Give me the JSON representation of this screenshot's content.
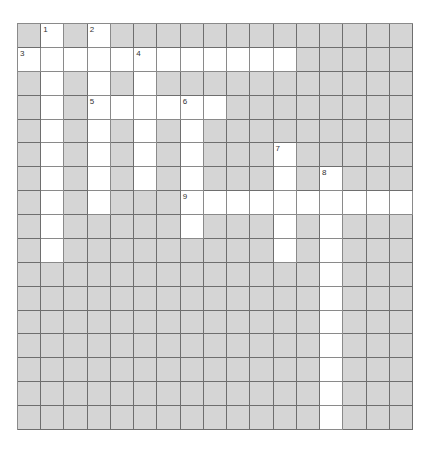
{
  "puzzle": {
    "rows": 17,
    "cols": 17,
    "colors": {
      "block": "#d5d5d5",
      "open": "#ffffff",
      "line": "#6e6e6e"
    },
    "open_cells": [
      [
        0,
        1
      ],
      [
        0,
        3
      ],
      [
        1,
        0
      ],
      [
        1,
        1
      ],
      [
        1,
        2
      ],
      [
        1,
        3
      ],
      [
        1,
        4
      ],
      [
        1,
        5
      ],
      [
        1,
        6
      ],
      [
        1,
        7
      ],
      [
        1,
        8
      ],
      [
        1,
        9
      ],
      [
        1,
        10
      ],
      [
        1,
        11
      ],
      [
        2,
        1
      ],
      [
        2,
        3
      ],
      [
        2,
        5
      ],
      [
        3,
        1
      ],
      [
        3,
        3
      ],
      [
        3,
        4
      ],
      [
        3,
        5
      ],
      [
        3,
        6
      ],
      [
        3,
        7
      ],
      [
        3,
        8
      ],
      [
        4,
        1
      ],
      [
        4,
        3
      ],
      [
        4,
        5
      ],
      [
        4,
        7
      ],
      [
        5,
        1
      ],
      [
        5,
        3
      ],
      [
        5,
        5
      ],
      [
        5,
        7
      ],
      [
        5,
        11
      ],
      [
        6,
        1
      ],
      [
        6,
        3
      ],
      [
        6,
        5
      ],
      [
        6,
        7
      ],
      [
        6,
        11
      ],
      [
        6,
        13
      ],
      [
        7,
        1
      ],
      [
        7,
        3
      ],
      [
        7,
        7
      ],
      [
        7,
        8
      ],
      [
        7,
        9
      ],
      [
        7,
        10
      ],
      [
        7,
        11
      ],
      [
        7,
        12
      ],
      [
        7,
        13
      ],
      [
        7,
        14
      ],
      [
        7,
        15
      ],
      [
        7,
        16
      ],
      [
        8,
        1
      ],
      [
        8,
        7
      ],
      [
        8,
        11
      ],
      [
        8,
        13
      ],
      [
        9,
        1
      ],
      [
        9,
        11
      ],
      [
        9,
        13
      ],
      [
        10,
        13
      ],
      [
        11,
        13
      ],
      [
        12,
        13
      ],
      [
        13,
        13
      ],
      [
        14,
        13
      ],
      [
        15,
        13
      ],
      [
        16,
        13
      ]
    ],
    "clue_numbers": [
      {
        "row": 0,
        "col": 1,
        "label": "1"
      },
      {
        "row": 0,
        "col": 3,
        "label": "2"
      },
      {
        "row": 1,
        "col": 0,
        "label": "3"
      },
      {
        "row": 1,
        "col": 5,
        "label": "4"
      },
      {
        "row": 3,
        "col": 3,
        "label": "5"
      },
      {
        "row": 3,
        "col": 7,
        "label": "6"
      },
      {
        "row": 5,
        "col": 11,
        "label": "7"
      },
      {
        "row": 6,
        "col": 13,
        "label": "8"
      },
      {
        "row": 7,
        "col": 7,
        "label": "9"
      }
    ]
  }
}
